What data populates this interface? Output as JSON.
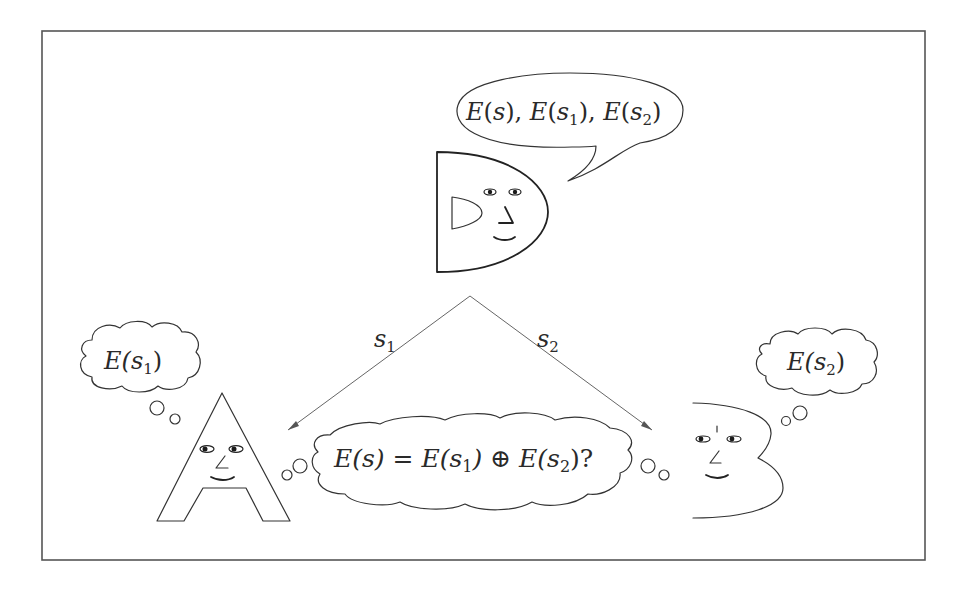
{
  "diagram": {
    "dealer": {
      "name": "D",
      "speech": {
        "parts": [
          {
            "t": "E",
            "i": true
          },
          {
            "t": "(",
            "i": false
          },
          {
            "t": "s",
            "i": true
          },
          {
            "t": "), ",
            "i": false
          },
          {
            "t": "E",
            "i": true
          },
          {
            "t": "(",
            "i": false
          },
          {
            "t": "s",
            "i": true
          },
          {
            "t": "1",
            "sub": true
          },
          {
            "t": "), ",
            "i": false
          },
          {
            "t": "E",
            "i": true
          },
          {
            "t": "(",
            "i": false
          },
          {
            "t": "s",
            "i": true
          },
          {
            "t": "2",
            "sub": true
          },
          {
            "t": ")",
            "i": false
          }
        ],
        "text": "E(s), E(s1), E(s2)"
      }
    },
    "party_a": {
      "name": "A",
      "thought": {
        "text": "E(s1)",
        "main": "E(s",
        "sub": "1",
        "close": ")"
      }
    },
    "party_b": {
      "name": "B",
      "thought": {
        "text": "E(s2)",
        "main": "E(s",
        "sub": "2",
        "close": ")"
      }
    },
    "arrows": [
      {
        "label": "s",
        "sub": "1",
        "to": "A"
      },
      {
        "label": "s",
        "sub": "2",
        "to": "B"
      }
    ],
    "shared_thought": {
      "text": "E(s) = E(s1) ⊕ E(s2)?",
      "p1": "E(s) = E(s",
      "sub1": "1",
      "p2": ") ⊕ E(s",
      "sub2": "2",
      "p3": ")?"
    },
    "colors": {
      "stroke": "#333333",
      "frame": "#555555",
      "background": "#ffffff"
    }
  }
}
